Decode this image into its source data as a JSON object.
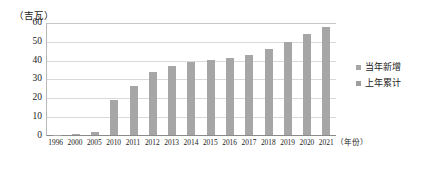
{
  "chart_data": {
    "type": "bar",
    "title": "",
    "ylabel": "（吉瓦）",
    "xlabel": "（年份）",
    "ylim": [
      0,
      60
    ],
    "yticks": [
      60,
      50,
      40,
      30,
      20,
      10,
      0
    ],
    "grid": true,
    "legend_position": "right",
    "categories": [
      "1996",
      "2000",
      "2005",
      "2010",
      "2011",
      "2012",
      "2013",
      "2014",
      "2015",
      "2016",
      "2017",
      "2018",
      "2019",
      "2020",
      "2021"
    ],
    "series": [
      {
        "name": "当年新增",
        "color": "#a6a6a6",
        "values": [
          0.2,
          0.6,
          1.5,
          19,
          26,
          34,
          37,
          39,
          40,
          41,
          43,
          46,
          50,
          54,
          58
        ]
      },
      {
        "name": "上年累计",
        "color": "#9d9d9d",
        "values": [
          0,
          0,
          0,
          0,
          0,
          0,
          0,
          0,
          0,
          0,
          0,
          0,
          0,
          0,
          0
        ]
      }
    ],
    "values": [
      0.2,
      0.6,
      1.5,
      19,
      26,
      34,
      37,
      39,
      40,
      41,
      43,
      46,
      50,
      54,
      58
    ]
  },
  "legend": {
    "items": [
      {
        "label": "当年新增",
        "color": "#a6a6a6"
      },
      {
        "label": "上年累计",
        "color": "#9d9d9d"
      }
    ]
  },
  "axes": {
    "y_unit_label": "（吉瓦）",
    "x_unit_label": "（年份）"
  }
}
